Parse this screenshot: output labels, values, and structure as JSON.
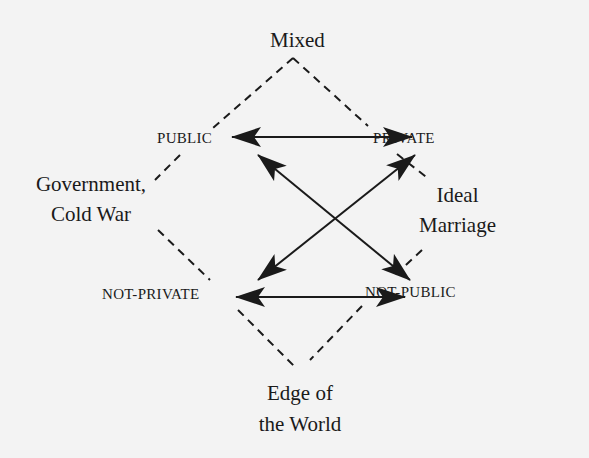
{
  "diagram": {
    "corners": {
      "top": "Mixed",
      "left_line1": "Government,",
      "left_line2": "Cold War",
      "right_line1": "Ideal",
      "right_line2": "Marriage",
      "bottom_line1": "Edge of",
      "bottom_line2": "the World"
    },
    "nodes": {
      "public": "PUBLIC",
      "private": "PRIVATE",
      "not_private": "NOT-PRIVATE",
      "not_public": "NOT-PUBLIC"
    },
    "relations": [
      {
        "from": "PUBLIC",
        "to": "PRIVATE",
        "type": "double-arrow"
      },
      {
        "from": "NOT-PRIVATE",
        "to": "NOT-PUBLIC",
        "type": "double-arrow"
      },
      {
        "from": "PUBLIC",
        "to": "NOT-PUBLIC",
        "type": "double-arrow"
      },
      {
        "from": "PRIVATE",
        "to": "NOT-PRIVATE",
        "type": "double-arrow"
      }
    ],
    "colors": {
      "ink": "#1a1a1a",
      "background": "#f3f3f3"
    }
  }
}
